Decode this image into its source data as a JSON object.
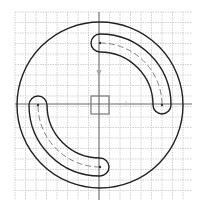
{
  "diagram": {
    "type": "cad-sketch",
    "grid": {
      "x_start": 15,
      "x_end": 192,
      "y_start": 12,
      "y_end": 200,
      "spacing": 10.5,
      "color": "#c8c8c8"
    },
    "axes": {
      "origin_x": 99,
      "origin_y": 104,
      "color": "#555555",
      "y_arrow": {
        "x": 99,
        "y": 75,
        "color": "#9a9a9a"
      },
      "x_arrow": {
        "x": 126,
        "y": 101,
        "color": "#c0c0c0"
      }
    },
    "origin_box": {
      "x": 91,
      "y": 96,
      "size": 18,
      "color": "#777777"
    },
    "outer_circle": {
      "cx": 100,
      "cy": 105,
      "r": 83,
      "color": "#222222"
    },
    "slots": [
      {
        "name": "upper-right-slot",
        "centerline_radius": 62,
        "width": 18,
        "start_angle_deg": -90,
        "end_angle_deg": 0,
        "color": "#222222"
      },
      {
        "name": "lower-left-slot",
        "centerline_radius": 62,
        "width": 18,
        "start_angle_deg": 90,
        "end_angle_deg": 180,
        "color": "#222222"
      }
    ]
  }
}
